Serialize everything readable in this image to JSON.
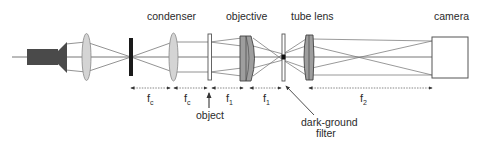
{
  "diagram": {
    "components": {
      "lamp": "light source",
      "collector": "collector lens",
      "aperture": "aperture stop",
      "condenser": "condenser",
      "object": "object",
      "objective": "objective",
      "filter": "dark-ground filter",
      "tube_lens": "tube lens",
      "camera": "camera"
    },
    "labels": {
      "condenser": "condenser",
      "objective": "objective",
      "tube_lens": "tube lens",
      "camera": "camera",
      "object": "object",
      "filter_line1": "dark-ground",
      "filter_line2": "filter"
    },
    "distances": [
      {
        "symbol": "f",
        "subscript": "c",
        "from": "aperture",
        "to": "condenser"
      },
      {
        "symbol": "f",
        "subscript": "c",
        "from": "condenser",
        "to": "object"
      },
      {
        "symbol": "f",
        "subscript": "1",
        "from": "object",
        "to": "objective"
      },
      {
        "symbol": "f",
        "subscript": "1",
        "from": "objective",
        "to": "filter"
      },
      {
        "symbol": "f",
        "subscript": "2",
        "from": "tube lens",
        "to": "camera"
      }
    ],
    "colors": {
      "line": "#555555",
      "lamp": "#4a4a4a",
      "lens_light": "#d6d6d6",
      "lens_dark": "#9a9a9a",
      "aperture": "#1a1a1a",
      "text": "#2a2a2a"
    }
  }
}
